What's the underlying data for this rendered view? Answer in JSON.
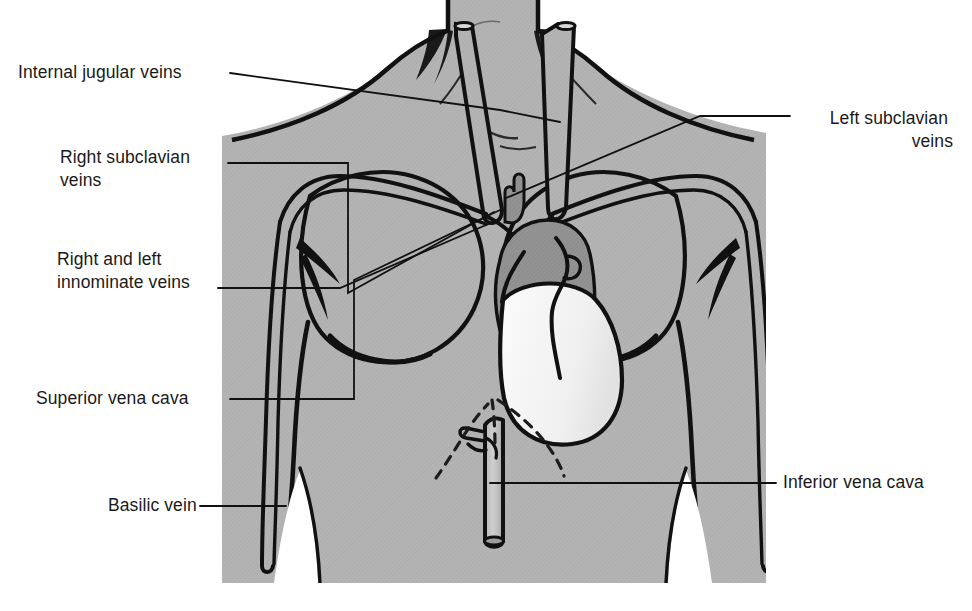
{
  "figure": {
    "background_color": "#ffffff",
    "body_fill": "#b3b3b3",
    "organ_fill_dark": "#8f8f8f",
    "organ_fill_light": "#f2f2f2",
    "line_color": "#111111"
  },
  "labels": [
    {
      "id": "internal-jugular-veins",
      "lines": [
        "Internal jugular veins"
      ],
      "align": "left",
      "x": 18,
      "y": 78,
      "leader": "leader-internal-jugular"
    },
    {
      "id": "right-subclavian-veins",
      "lines": [
        "Right subclavian",
        "veins"
      ],
      "align": "left",
      "x": 60,
      "y": 163,
      "leader": "leader-right-subclavian"
    },
    {
      "id": "right-and-left-innominate-veins",
      "lines": [
        "Right and left",
        "innominate veins"
      ],
      "align": "left",
      "x": 57,
      "y": 265,
      "leader": "leader-innominate"
    },
    {
      "id": "superior-vena-cava",
      "lines": [
        "Superior vena cava"
      ],
      "align": "left",
      "x": 36,
      "y": 404,
      "leader": "leader-superior-vena-cava"
    },
    {
      "id": "basilic-vein",
      "lines": [
        "Basilic vein"
      ],
      "align": "left",
      "x": 108,
      "y": 511,
      "leader": "leader-basilic-vein"
    },
    {
      "id": "left-subclavian-veins",
      "lines": [
        "Left subclavian",
        "veins"
      ],
      "align": "right",
      "x": 953,
      "y": 124,
      "leader": "leader-left-subclavian"
    },
    {
      "id": "inferior-vena-cava",
      "lines": [
        "Inferior vena cava"
      ],
      "align": "left",
      "x": 783,
      "y": 488,
      "leader": "leader-inferior-vena-cava"
    }
  ]
}
